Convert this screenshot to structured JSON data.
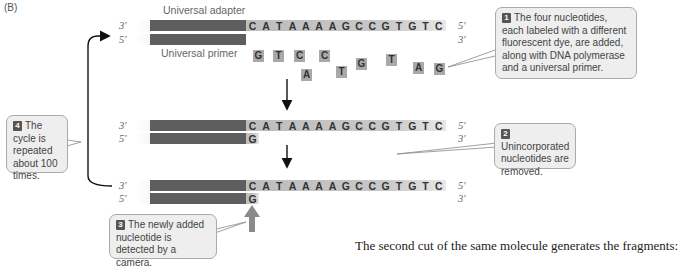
{
  "panel": "(B)",
  "labels": {
    "universal_adapter": "Universal adapter",
    "universal_primer": "Universal primer"
  },
  "strand_ends": {
    "three_prime": "3′",
    "five_prime": "5′"
  },
  "template_sequence": [
    "C",
    "A",
    "T",
    "A",
    "A",
    "A",
    "A",
    "G",
    "C",
    "C",
    "G",
    "T",
    "G",
    "T",
    "C"
  ],
  "free_nucleotides": [
    {
      "base": "G",
      "x": 253,
      "y": 50
    },
    {
      "base": "T",
      "x": 273,
      "y": 50
    },
    {
      "base": "C",
      "x": 294,
      "y": 50
    },
    {
      "base": "A",
      "x": 301,
      "y": 69
    },
    {
      "base": "C",
      "x": 319,
      "y": 50
    },
    {
      "base": "T",
      "x": 336,
      "y": 66
    },
    {
      "base": "G",
      "x": 356,
      "y": 58
    },
    {
      "base": "T",
      "x": 386,
      "y": 54
    },
    {
      "base": "A",
      "x": 413,
      "y": 62
    },
    {
      "base": "G",
      "x": 434,
      "y": 63
    }
  ],
  "incorporated_base": "G",
  "callouts": {
    "step1": {
      "num": "1",
      "text": "The four nucleotides, each labeled with a different fluorescent dye, are added, along with DNA polymerase and a universal primer."
    },
    "step2": {
      "num": "2",
      "text": "Unincorporated nucleotides are removed."
    },
    "step3": {
      "num": "3",
      "text": "The newly added nucleotide is detected by a camera."
    },
    "step4": {
      "num": "4",
      "text": "The cycle is repeated about 100 times."
    }
  },
  "caption": "The second cut of the same molecule generates the fragments:",
  "colors": {
    "adapter_dark": "#5e5e5e",
    "sequence_bg": "#c4c4c4",
    "callout_bg": "#eeeeee",
    "camera_arrow": "#8a8a8a"
  }
}
